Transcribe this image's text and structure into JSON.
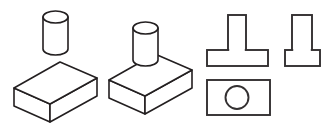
{
  "figure": {
    "background_color": "#ffffff",
    "line_color": "#231f20",
    "ortho_line_color": "#333031",
    "line_width": 1.6
  },
  "groups": {
    "exploded": {
      "label": "Exploded assembly: cylinder above rectangular block",
      "parts": [
        {
          "name": "cylinder",
          "shape": "cylinder",
          "center_x": 55.5,
          "top_y": 17,
          "bottom_y": 49,
          "radius_x": 12.5,
          "radius_y": 6
        },
        {
          "name": "rectangular-block",
          "shape": "isometric-box",
          "top_left_x": 14,
          "top_left_y": 88,
          "top_back_x": 60,
          "top_back_y": 62,
          "top_right_x": 97,
          "top_right_y": 78,
          "top_front_x": 50,
          "top_front_y": 104,
          "height": 18
        }
      ]
    },
    "assembled": {
      "label": "Assembled isometric view: cylinder seated on block",
      "parts": [
        {
          "name": "cylinder",
          "shape": "cylinder",
          "center_x": 145.5,
          "top_y": 28,
          "bottom_y": 60,
          "radius_x": 12.5,
          "radius_y": 6
        },
        {
          "name": "rectangular-block",
          "shape": "isometric-box",
          "top_left_x": 109,
          "top_left_y": 80,
          "top_back_x": 155,
          "top_back_y": 54,
          "top_right_x": 192,
          "top_right_y": 70,
          "top_front_x": 145,
          "top_front_y": 96,
          "height": 18
        }
      ]
    },
    "orthographic": {
      "label": "Three orthographic projection views",
      "views": [
        {
          "name": "front-view",
          "description": "T-shaped front elevation",
          "base": {
            "x": 207,
            "y": 50,
            "width": 61,
            "height": 16
          },
          "stem": {
            "x": 228,
            "y": 15,
            "width": 18,
            "height": 35
          }
        },
        {
          "name": "side-view",
          "description": "Narrow stem on wider base",
          "base": {
            "x": 285,
            "y": 50,
            "width": 35,
            "height": 16
          },
          "stem": {
            "x": 292,
            "y": 15,
            "width": 20,
            "height": 35
          }
        },
        {
          "name": "top-view",
          "description": "Rectangle with centered circle",
          "rect": {
            "x": 207,
            "y": 80,
            "width": 63,
            "height": 35
          },
          "circle": {
            "cx": 237,
            "cy": 97.5,
            "r": 11.5
          }
        }
      ]
    }
  }
}
